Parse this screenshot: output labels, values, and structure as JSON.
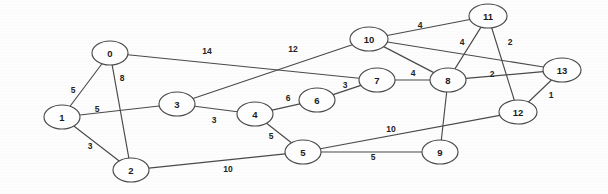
{
  "figure": {
    "type": "undirected-weighted-graph",
    "title": "",
    "background_color": "#fdfdfd",
    "node_fill": "#ffffff",
    "stroke_color": "#4a4a4a",
    "text_color": "#1b1b1b"
  },
  "graph_data": {
    "type": "diagram",
    "node_count": 14,
    "edge_count": 22,
    "nodes": [
      {
        "id": "0",
        "label": "0",
        "x": 110,
        "y": 53,
        "rx": 18,
        "ry": 12
      },
      {
        "id": "1",
        "label": "1",
        "x": 62,
        "y": 117,
        "rx": 18,
        "ry": 12
      },
      {
        "id": "2",
        "label": "2",
        "x": 131,
        "y": 170,
        "rx": 18,
        "ry": 12
      },
      {
        "id": "3",
        "label": "3",
        "x": 177,
        "y": 104,
        "rx": 18,
        "ry": 12
      },
      {
        "id": "4",
        "label": "4",
        "x": 255,
        "y": 114,
        "rx": 18,
        "ry": 12
      },
      {
        "id": "5",
        "label": "5",
        "x": 303,
        "y": 152,
        "rx": 18,
        "ry": 12
      },
      {
        "id": "6",
        "label": "6",
        "x": 317,
        "y": 100,
        "rx": 18,
        "ry": 12
      },
      {
        "id": "7",
        "label": "7",
        "x": 377,
        "y": 80,
        "rx": 18,
        "ry": 12
      },
      {
        "id": "8",
        "label": "8",
        "x": 448,
        "y": 80,
        "rx": 18,
        "ry": 12
      },
      {
        "id": "9",
        "label": "9",
        "x": 440,
        "y": 152,
        "rx": 18,
        "ry": 12
      },
      {
        "id": "10",
        "label": "10",
        "x": 369,
        "y": 39,
        "rx": 19,
        "ry": 12
      },
      {
        "id": "11",
        "label": "11",
        "x": 488,
        "y": 16,
        "rx": 19,
        "ry": 12
      },
      {
        "id": "12",
        "label": "12",
        "x": 518,
        "y": 112,
        "rx": 19,
        "ry": 12
      },
      {
        "id": "13",
        "label": "13",
        "x": 562,
        "y": 70,
        "rx": 19,
        "ry": 12
      }
    ],
    "edges": [
      {
        "source": "0",
        "target": "1",
        "weight": "5",
        "label_x": 73,
        "label_y": 90
      },
      {
        "source": "0",
        "target": "2",
        "weight": "8",
        "label_x": 122,
        "label_y": 78
      },
      {
        "source": "0",
        "target": "7",
        "weight": "14",
        "label_x": 207,
        "label_y": 51
      },
      {
        "source": "1",
        "target": "2",
        "weight": "3",
        "label_x": 90,
        "label_y": 146
      },
      {
        "source": "1",
        "target": "3",
        "weight": "5",
        "label_x": 97,
        "label_y": 109
      },
      {
        "source": "2",
        "target": "5",
        "weight": "10",
        "label_x": 228,
        "label_y": 169
      },
      {
        "source": "3",
        "target": "4",
        "weight": "3",
        "label_x": 214,
        "label_y": 120
      },
      {
        "source": "3",
        "target": "10",
        "weight": "12",
        "label_x": 293,
        "label_y": 49
      },
      {
        "source": "4",
        "target": "5",
        "weight": "5",
        "label_x": 271,
        "label_y": 136
      },
      {
        "source": "4",
        "target": "6",
        "weight": "6",
        "label_x": 288,
        "label_y": 98
      },
      {
        "source": "5",
        "target": "9",
        "weight": "5",
        "label_x": 373,
        "label_y": 157
      },
      {
        "source": "5",
        "target": "12",
        "weight": "10",
        "label_x": 391,
        "label_y": 129
      },
      {
        "source": "6",
        "target": "7",
        "weight": "3",
        "label_x": 345,
        "label_y": 85
      },
      {
        "source": "7",
        "target": "8",
        "weight": "4",
        "label_x": 413,
        "label_y": 73
      },
      {
        "source": "8",
        "target": "9",
        "weight": "",
        "label_x": 0,
        "label_y": 0
      },
      {
        "source": "8",
        "target": "11",
        "weight": "4",
        "label_x": 462,
        "label_y": 42
      },
      {
        "source": "8",
        "target": "13",
        "weight": "2",
        "label_x": 492,
        "label_y": 74
      },
      {
        "source": "8",
        "target": "10",
        "weight": "",
        "label_x": 0,
        "label_y": 0
      },
      {
        "source": "10",
        "target": "11",
        "weight": "4",
        "label_x": 420,
        "label_y": 25
      },
      {
        "source": "11",
        "target": "12",
        "weight": "2",
        "label_x": 510,
        "label_y": 42
      },
      {
        "source": "12",
        "target": "13",
        "weight": "1",
        "label_x": 551,
        "label_y": 95
      },
      {
        "source": "10",
        "target": "13",
        "weight": "",
        "label_x": 0,
        "label_y": 0
      }
    ],
    "edge_labels_visible": [
      "5",
      "8",
      "14",
      "3",
      "5",
      "10",
      "3",
      "12",
      "5",
      "6",
      "5",
      "10",
      "3",
      "4",
      "4",
      "2",
      "4",
      "2",
      "1"
    ],
    "node_labels_visible": [
      "0",
      "1",
      "2",
      "3",
      "4",
      "5",
      "6",
      "7",
      "8",
      "9",
      "10",
      "11",
      "12",
      "13"
    ]
  }
}
